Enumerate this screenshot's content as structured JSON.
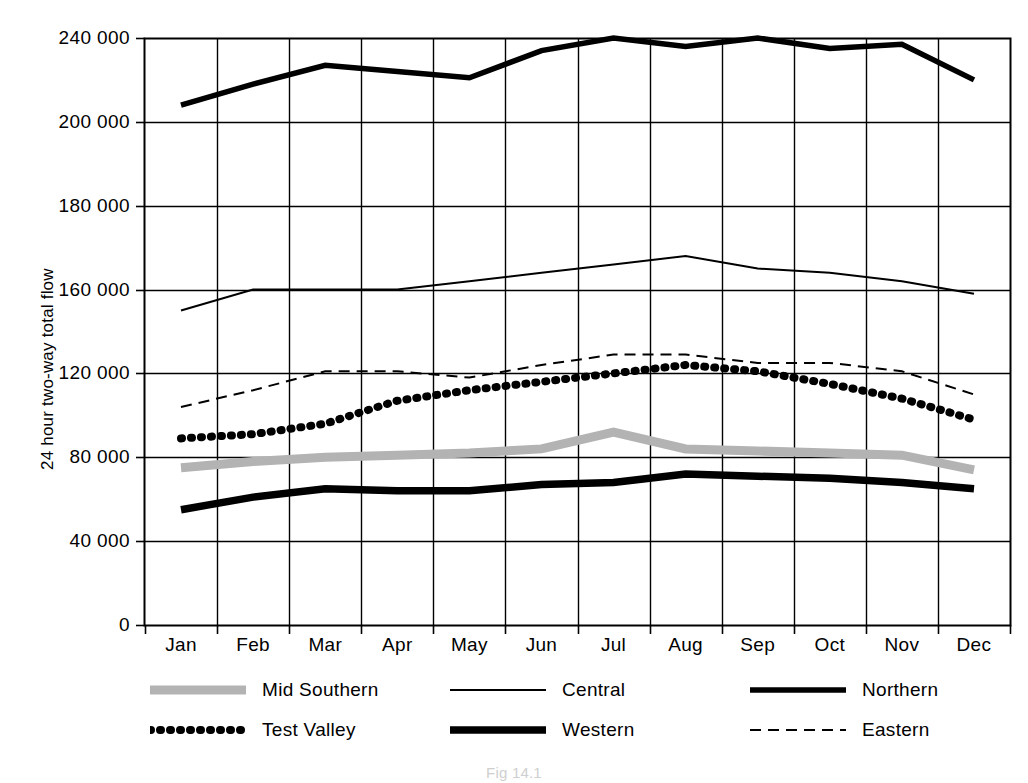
{
  "chart_data": {
    "type": "line",
    "title": "",
    "xlabel": "",
    "ylabel": "24 hour two-way total flow",
    "categories": [
      "Jan",
      "Feb",
      "Mar",
      "Apr",
      "May",
      "Jun",
      "Jul",
      "Aug",
      "Sep",
      "Oct",
      "Nov",
      "Dec"
    ],
    "ytick_labels": [
      "0",
      "40 000",
      "80 000",
      "120 000",
      "160 000",
      "180 000",
      "200 000",
      "240 000"
    ],
    "ytick_values": [
      0,
      40000,
      80000,
      120000,
      160000,
      180000,
      200000,
      240000
    ],
    "ylim": [
      0,
      240000
    ],
    "grid": "both",
    "legend_position": "below-axes",
    "series": [
      {
        "name": "Mid Southern",
        "style": "thick-gray-solid",
        "color": "#b3b3b3",
        "values": [
          75000,
          78000,
          80000,
          81000,
          82000,
          84000,
          92000,
          84000,
          83000,
          82000,
          81000,
          74000
        ]
      },
      {
        "name": "Central",
        "style": "thin-black-solid",
        "color": "#000000",
        "values": [
          150000,
          160000,
          160000,
          160000,
          162000,
          164000,
          166000,
          168000,
          165000,
          164000,
          162000,
          158000
        ]
      },
      {
        "name": "Northern",
        "style": "medium-black-solid",
        "color": "#000000",
        "values": [
          208000,
          218000,
          227000,
          224000,
          221000,
          234000,
          241000,
          236000,
          242000,
          235000,
          237000,
          220000
        ]
      },
      {
        "name": "Test Valley",
        "style": "black-dotted",
        "color": "#000000",
        "values": [
          89000,
          91000,
          96000,
          107000,
          112000,
          116000,
          120000,
          124000,
          121000,
          115000,
          108000,
          98000
        ]
      },
      {
        "name": "Western",
        "style": "extra-thick-black-solid",
        "color": "#000000",
        "values": [
          55000,
          61000,
          65000,
          64000,
          64000,
          67000,
          68000,
          72000,
          71000,
          70000,
          68000,
          65000
        ]
      },
      {
        "name": "Eastern",
        "style": "thin-black-dashed",
        "color": "#000000",
        "values": [
          104000,
          112000,
          121000,
          121000,
          118000,
          124000,
          129000,
          129000,
          125000,
          125000,
          121000,
          110000
        ]
      }
    ]
  },
  "axis": {
    "y_title": "24 hour two-way total flow"
  },
  "legend": {
    "entries": [
      {
        "label": "Mid Southern",
        "swatch": "mid-southern-swatch"
      },
      {
        "label": "Central",
        "swatch": "central-swatch"
      },
      {
        "label": "Northern",
        "swatch": "northern-swatch"
      },
      {
        "label": "Test Valley",
        "swatch": "test-valley-swatch"
      },
      {
        "label": "Western",
        "swatch": "western-swatch"
      },
      {
        "label": "Eastern",
        "swatch": "eastern-swatch"
      }
    ]
  },
  "caption": {
    "text": "Fig 14.1"
  },
  "colors": {
    "ink": "#000000",
    "grid": "#000000",
    "mid_southern_gray": "#b3b3b3",
    "background": "#ffffff"
  }
}
